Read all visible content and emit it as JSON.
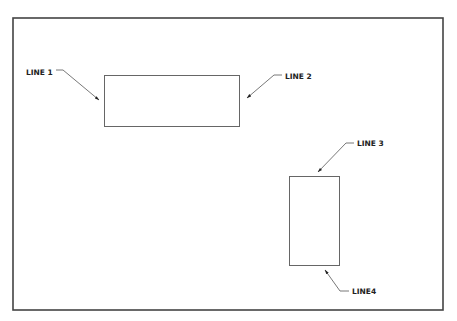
{
  "diagram": {
    "labels": {
      "line1": "LINE 1",
      "line2": "LINE 2",
      "line3": "LINE 3",
      "line4": "LINE4"
    },
    "colors": {
      "frame": "#444444",
      "shape": "#666666",
      "leader": "#555555",
      "text": "#222222"
    }
  }
}
